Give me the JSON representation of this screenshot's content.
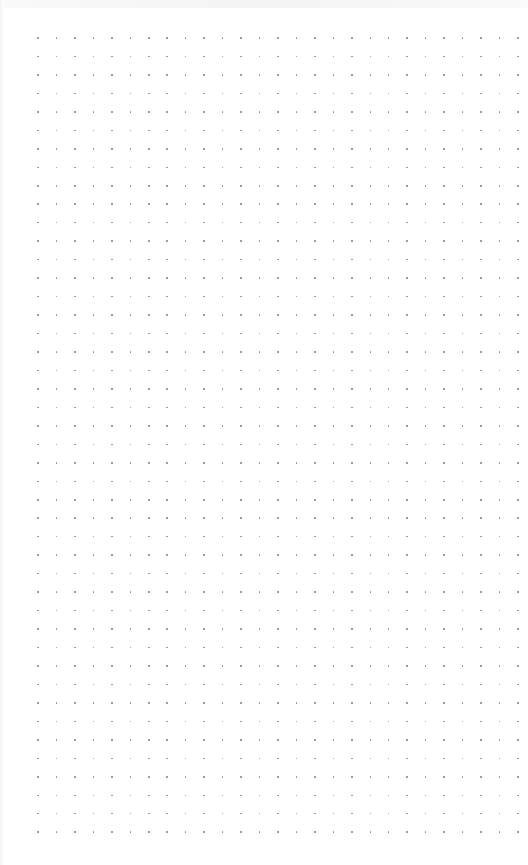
{
  "canvas": {
    "background": "#ffffff",
    "dot_color": "#8a8a8a",
    "grid": {
      "columns": 27,
      "rows": 44,
      "origin_x": 38,
      "origin_y": 38,
      "spacing_x": 18.46,
      "spacing_y": 18.47
    }
  }
}
